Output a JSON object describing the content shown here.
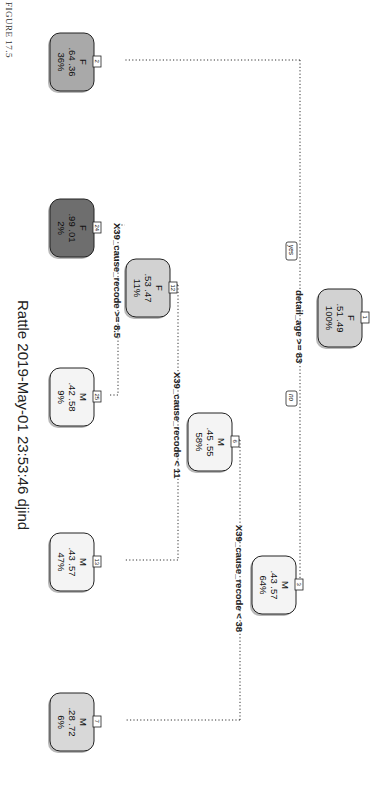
{
  "figure_label": "FIGURE 17.5",
  "footer": "Rattle 2019-May-01 23:53:46 djind",
  "colors": {
    "node_light_gray": "#d2d2d2",
    "node_mid_gray": "#a9a9a9",
    "node_dark_gray": "#6e6e6e",
    "node_white": "#f4f4f4",
    "connector": "#333333"
  },
  "tree": {
    "orientation": "rotated 90deg clockwise",
    "nodes": [
      {
        "id": "1",
        "class": "F",
        "probs": ".51  .49",
        "pct": "100%"
      },
      {
        "id": "2",
        "class": "F",
        "probs": ".64  .36",
        "pct": "36%"
      },
      {
        "id": "3",
        "class": "M",
        "probs": ".43  .57",
        "pct": "64%"
      },
      {
        "id": "6",
        "class": "M",
        "probs": ".45  .55",
        "pct": "58%"
      },
      {
        "id": "7",
        "class": "M",
        "probs": ".28  .72",
        "pct": "6%"
      },
      {
        "id": "12",
        "class": "F",
        "probs": ".53  .47",
        "pct": "11%"
      },
      {
        "id": "13",
        "class": "M",
        "probs": ".43  .57",
        "pct": "47%"
      },
      {
        "id": "24",
        "class": "F",
        "probs": ".99  .01",
        "pct": "2%"
      },
      {
        "id": "25",
        "class": "M",
        "probs": ".42  .58",
        "pct": "9%"
      }
    ],
    "splits": [
      {
        "node": "1",
        "label": "detail_age >= 83",
        "yes": "yes",
        "no": "no"
      },
      {
        "node": "3",
        "label": "X39_cause_recode < 38"
      },
      {
        "node": "6",
        "label": "X39_cause_recode < 11"
      },
      {
        "node": "12",
        "label": "X39_cause_recode >= 8.5"
      }
    ]
  }
}
